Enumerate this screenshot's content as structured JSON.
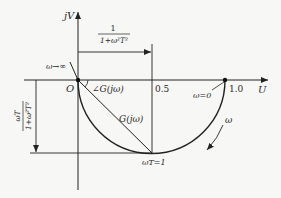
{
  "diagram": {
    "type": "nyquist-plot",
    "axes": {
      "vertical_label": "jV",
      "horizontal_label": "U",
      "origin_label": "O"
    },
    "ticks": {
      "half": "0.5",
      "one": "1.0"
    },
    "annotations": {
      "omega_inf": "ω→∞",
      "omega_zero": "ω=0",
      "omega_T1": "ωT=1",
      "angle": "∠G(jω)",
      "vector": "G(jω)",
      "direction": "ω",
      "real_dim_num": "1",
      "real_dim_den": "1+ω²T²",
      "imag_dim_num": "ωT",
      "imag_dim_den": "1+ω²T²"
    },
    "colors": {
      "line": "#222222",
      "background": "#f7f7f5"
    }
  }
}
